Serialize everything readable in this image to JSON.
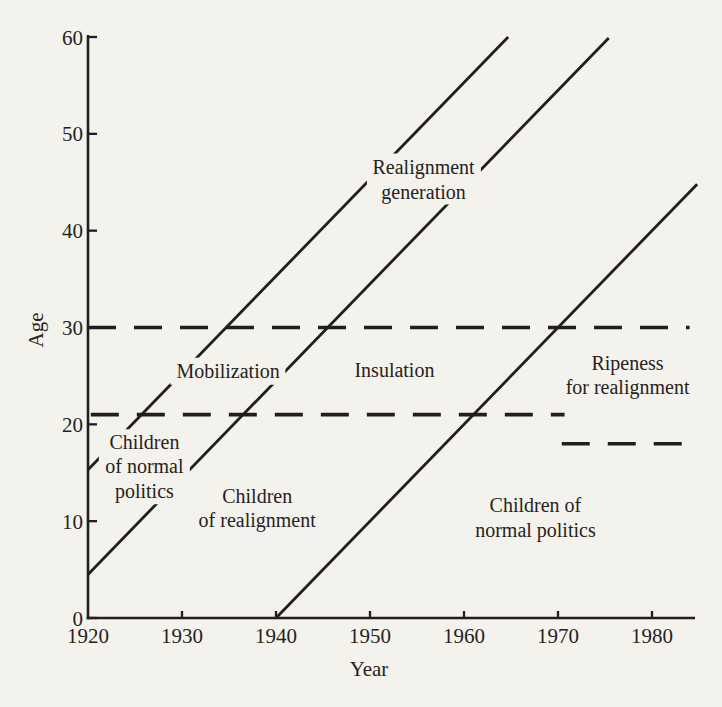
{
  "figure": {
    "background_color": "#f4f2ec",
    "ink_color": "#211f1b"
  },
  "chart_data": {
    "type": "line",
    "title": "",
    "xlabel": "Year",
    "ylabel": "Age",
    "x_ticks": [
      1920,
      1930,
      1940,
      1950,
      1960,
      1970,
      1980
    ],
    "y_ticks": [
      0,
      10,
      20,
      30,
      40,
      50,
      60
    ],
    "xlim": [
      1920,
      1984.8
    ],
    "ylim": [
      0,
      60
    ],
    "grid": false,
    "legend": "none",
    "cohort_lines": [
      {
        "name": "cohort-boundary-born-1905",
        "birth_year": 1905,
        "style": "solid",
        "points": [
          [
            1920,
            15.3
          ],
          [
            1964.7,
            60
          ]
        ]
      },
      {
        "name": "cohort-boundary-born-1915",
        "birth_year": 1915.5,
        "style": "solid",
        "points": [
          [
            1920,
            4.5
          ],
          [
            1975.4,
            59.9
          ]
        ]
      },
      {
        "name": "cohort-boundary-born-1940",
        "birth_year": 1940,
        "style": "solid",
        "points": [
          [
            1940,
            0
          ],
          [
            1984.8,
            44.8
          ]
        ]
      }
    ],
    "dashed_lines": [
      {
        "name": "age-30-threshold-dashed",
        "age": 30,
        "from_year": 1920,
        "to_year": 1984.0
      },
      {
        "name": "voting-age-21-dashed",
        "age": 21,
        "from_year": 1920.3,
        "to_year": 1970.7
      },
      {
        "name": "voting-age-18-dashed",
        "age": 18,
        "from_year": 1970.4,
        "to_year": 1984.0
      }
    ],
    "region_labels": [
      {
        "id": "realignment-generation",
        "lines": [
          "Realignment",
          "generation"
        ],
        "year": 1955.7,
        "age": 45.3
      },
      {
        "id": "mobilization",
        "lines": [
          "Mobilization"
        ],
        "year": 1934.9,
        "age": 25.5
      },
      {
        "id": "insulation",
        "lines": [
          "Insulation"
        ],
        "year": 1952.6,
        "age": 25.6
      },
      {
        "id": "ripeness-for-realignment",
        "lines": [
          "Ripeness",
          "for realignment"
        ],
        "year": 1977.4,
        "age": 25.1
      },
      {
        "id": "children-of-normal-politics-left",
        "lines": [
          "Children",
          "of normal",
          "politics"
        ],
        "year": 1926.0,
        "age": 15.6
      },
      {
        "id": "children-of-realignment",
        "lines": [
          "Children",
          "of realignment"
        ],
        "year": 1938.0,
        "age": 11.4
      },
      {
        "id": "children-of-normal-politics-right",
        "lines": [
          "Children of",
          "normal politics"
        ],
        "year": 1967.6,
        "age": 10.4
      }
    ]
  }
}
